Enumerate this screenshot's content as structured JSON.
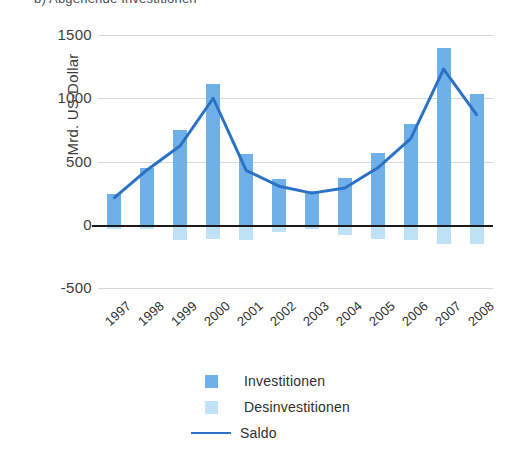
{
  "figure": {
    "heading": "b) Abgehende Investitionen"
  },
  "chart_data": {
    "type": "bar",
    "title": "b) Abgehende Investitionen",
    "xlabel": "",
    "ylabel": "Mrd. US-Dollar",
    "ylim": [
      -500,
      1500
    ],
    "yticks": [
      1500,
      1000,
      500,
      0,
      -500
    ],
    "ytick_labels": [
      "1500",
      "1000",
      "500",
      "0",
      "-500"
    ],
    "grid": true,
    "legend_position": "bottom-center",
    "categories": [
      "1997",
      "1998",
      "1999",
      "2000",
      "2001",
      "2002",
      "2003",
      "2004",
      "2005",
      "2006",
      "2007",
      "2008"
    ],
    "series": [
      {
        "name": "Investitionen",
        "kind": "bar",
        "color": "#6FB0E8",
        "values": [
          240,
          450,
          750,
          1110,
          560,
          360,
          270,
          370,
          570,
          800,
          1400,
          1030
        ]
      },
      {
        "name": "Desinvestitionen",
        "kind": "bar",
        "color": "#BFE2F7",
        "values": [
          -30,
          -30,
          -120,
          -110,
          -120,
          -60,
          -30,
          -80,
          -110,
          -120,
          -150,
          -150
        ]
      },
      {
        "name": "Saldo",
        "kind": "line",
        "color": "#2B72C6",
        "values": [
          215,
          435,
          625,
          1000,
          430,
          305,
          250,
          290,
          450,
          680,
          1230,
          870
        ]
      }
    ]
  },
  "legend": {
    "items": [
      {
        "label": "Investitionen",
        "marker": "square",
        "color": "#6FB0E8"
      },
      {
        "label": "Desinvestitionen",
        "marker": "square",
        "color": "#BFE2F7"
      },
      {
        "label": "Saldo",
        "marker": "line",
        "color": "#2B72C6"
      }
    ]
  }
}
